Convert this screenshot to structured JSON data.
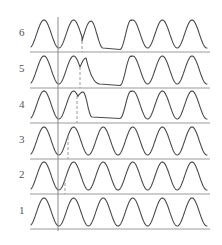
{
  "diagram": {
    "type": "stacked-waveforms",
    "colors": {
      "wave": "#4a4a4a",
      "baseline": "#9a9a9a",
      "solid_marker": "#8a8a8a",
      "dashed_marker": "#9a9a9a",
      "label": "#555555"
    },
    "x_start": 31,
    "x_end": 207,
    "baseline_x_start": 30,
    "baseline_x_end": 210,
    "period": 29.6,
    "first_peak_x": 44,
    "solid_marker": {
      "x": 58,
      "y_top": 17,
      "y_bottom": 231
    },
    "rows": [
      {
        "label": "6",
        "label_y": 36,
        "baseline_y": 52,
        "top_y": 20,
        "bottom_y": 48,
        "dashed_x": 82,
        "dashed_top_y": 41,
        "anomaly": {
          "kind": "notch-plateau",
          "notch_x": 82,
          "notch_y": 41,
          "second_peak_x": 91,
          "second_peak_y": 21,
          "plateau_start_x": 103,
          "plateau_end_x": 120,
          "plateau_y": 48,
          "resume_peak_x": 131
        }
      },
      {
        "label": "5",
        "label_y": 72,
        "baseline_y": 88,
        "top_y": 56,
        "bottom_y": 84,
        "dashed_x": 80,
        "dashed_top_y": 67,
        "anomaly": {
          "kind": "notch-decay",
          "notch_x": 80,
          "notch_y": 67,
          "second_peak_x": 86,
          "second_peak_y": 58,
          "plateau_start_x": 100,
          "plateau_end_x": 120,
          "plateau_y": 84,
          "resume_peak_x": 131
        }
      },
      {
        "label": "4",
        "label_y": 108,
        "baseline_y": 123,
        "top_y": 91,
        "bottom_y": 119,
        "dashed_x": 77,
        "dashed_top_y": 96,
        "anomaly": {
          "kind": "notch-drop",
          "notch_x": 78,
          "notch_y": 96,
          "second_peak_x": 83,
          "second_peak_y": 92,
          "plateau_start_x": 92,
          "plateau_end_x": 120,
          "plateau_y": 117,
          "resume_peak_x": 131
        }
      },
      {
        "label": "3",
        "label_y": 143,
        "baseline_y": 159,
        "top_y": 127,
        "bottom_y": 155,
        "dashed_x": 68,
        "dashed_top_y": 137,
        "anomaly": null
      },
      {
        "label": "2",
        "label_y": 178,
        "baseline_y": 194,
        "top_y": 162,
        "bottom_y": 190,
        "dashed_x": 65,
        "dashed_top_y": 178,
        "anomaly": null
      },
      {
        "label": "1",
        "label_y": 214,
        "baseline_y": 229,
        "top_y": 198,
        "bottom_y": 226,
        "dashed_x": null,
        "dashed_top_y": null,
        "anomaly": null
      }
    ]
  }
}
